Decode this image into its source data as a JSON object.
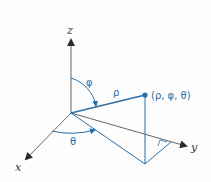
{
  "diagram": {
    "axes": {
      "x_label": "x",
      "y_label": "y",
      "z_label": "z"
    },
    "labels": {
      "rho": "ρ",
      "phi": "φ",
      "theta": "θ",
      "point": "(ρ, φ, θ)"
    },
    "colors": {
      "axis": "#3a3a3a",
      "accent": "#2a6fa8",
      "background": "#fdfdfd"
    }
  }
}
